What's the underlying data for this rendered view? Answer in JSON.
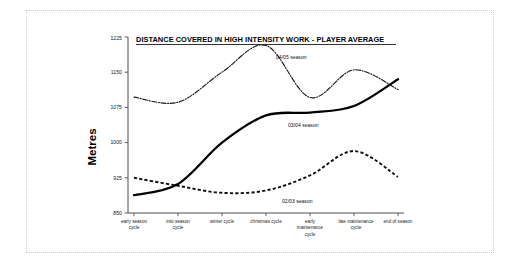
{
  "slide": {
    "background_color": "#ffffff",
    "frame_color": "#c9c9cf"
  },
  "chart_data": {
    "type": "line",
    "title": "DISTANCE COVERED IN HIGH INTENSITY WORK - PLAYER AVERAGE",
    "xlabel": "",
    "ylabel": "Metres",
    "ylim": [
      850,
      1225
    ],
    "yticks": [
      850,
      925,
      1000,
      1075,
      1150,
      1225
    ],
    "ytick_labels": [
      "850",
      "925",
      "1000",
      "1075",
      "1150",
      "1225"
    ],
    "grid": false,
    "legend_position": "inline-annotations",
    "categories": [
      "early season cycle",
      "into season cycle",
      "winter cycle",
      "christmas cycle",
      "early maintenance cycle",
      "late maintenance cycle",
      "end of season"
    ],
    "series": [
      {
        "name": "04/05 season",
        "style": "dash-dot",
        "color": "#1a1a1a",
        "values": [
          1097,
          1086,
          1150,
          1207,
          1096,
          1155,
          1113
        ]
      },
      {
        "name": "03/04 season",
        "style": "solid",
        "color": "#000000",
        "values": [
          888,
          912,
          1000,
          1058,
          1064,
          1078,
          1135
        ]
      },
      {
        "name": "02/03 season",
        "style": "dashed",
        "color": "#111111",
        "values": [
          925,
          908,
          893,
          898,
          930,
          982,
          927
        ]
      }
    ],
    "annotations": [
      {
        "text": "04/05 season",
        "series": "04/05 season"
      },
      {
        "text": "03/04 season",
        "series": "03/04 season"
      },
      {
        "text": "02/03 season",
        "series": "02/03 season"
      }
    ]
  }
}
